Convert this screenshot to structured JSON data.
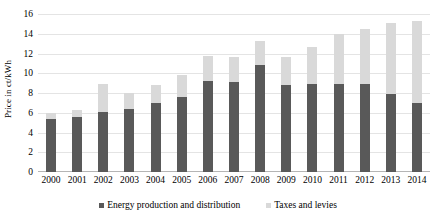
{
  "chart_data": {
    "type": "bar",
    "stacked": true,
    "title": "",
    "xlabel": "",
    "ylabel": "Price in ct/kWh",
    "ylim": [
      0,
      16
    ],
    "yticks": [
      0,
      2,
      4,
      6,
      8,
      10,
      12,
      14,
      16
    ],
    "grid": true,
    "legend_position": "bottom",
    "categories": [
      "2000",
      "2001",
      "2002",
      "2003",
      "2004",
      "2005",
      "2006",
      "2007",
      "2008",
      "2009",
      "2010",
      "2011",
      "2012",
      "2013",
      "2014"
    ],
    "series": [
      {
        "name": "Energy production and distribution",
        "color": "#595959",
        "values": [
          5.4,
          5.6,
          6.1,
          6.4,
          7.0,
          7.6,
          9.2,
          9.1,
          10.8,
          8.8,
          8.9,
          8.9,
          8.9,
          7.9,
          7.0
        ]
      },
      {
        "name": "Taxes and levies",
        "color": "#D9D9D9",
        "values": [
          0.6,
          0.7,
          2.8,
          1.6,
          1.8,
          2.2,
          2.5,
          2.5,
          2.5,
          2.8,
          3.8,
          5.1,
          5.6,
          7.2,
          8.3
        ]
      }
    ],
    "totals": [
      6.0,
      6.3,
      8.9,
      8.0,
      8.8,
      9.8,
      11.7,
      11.6,
      13.3,
      11.6,
      12.7,
      14.0,
      14.5,
      15.1,
      15.3
    ]
  },
  "legend": {
    "items": [
      {
        "label": "Energy production and distribution"
      },
      {
        "label": "Taxes and levies"
      }
    ]
  }
}
